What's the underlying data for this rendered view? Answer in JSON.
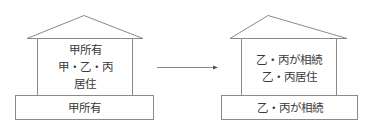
{
  "left_house": {
    "body_lines": [
      "甲所有",
      "甲・乙・丙",
      "居住"
    ],
    "base_label": "甲所有"
  },
  "arrow": {
    "direction": "right"
  },
  "right_house": {
    "body_lines": [
      "乙・丙が相続",
      "乙・丙居住"
    ],
    "base_label": "乙・丙が相続"
  },
  "colors": {
    "stroke": "#8a8a8a",
    "text": "#3a3a3a",
    "background": "#ffffff"
  }
}
